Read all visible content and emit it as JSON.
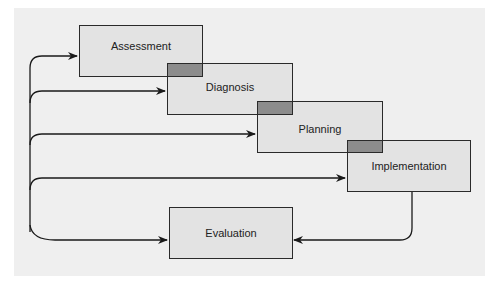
{
  "diagram": {
    "type": "nursing-process-flow",
    "steps": [
      {
        "id": "assessment",
        "label": "Assessment"
      },
      {
        "id": "diagnosis",
        "label": "Diagnosis"
      },
      {
        "id": "planning",
        "label": "Planning"
      },
      {
        "id": "implementation",
        "label": "Implementation"
      },
      {
        "id": "evaluation",
        "label": "Evaluation"
      }
    ],
    "connections": [
      {
        "from": "evaluation-feedback-loop",
        "to": "assessment"
      },
      {
        "from": "evaluation-feedback-loop",
        "to": "diagnosis"
      },
      {
        "from": "evaluation-feedback-loop",
        "to": "planning"
      },
      {
        "from": "evaluation-feedback-loop",
        "to": "implementation"
      },
      {
        "from": "evaluation-feedback-loop",
        "to": "evaluation"
      },
      {
        "from": "implementation",
        "to": "evaluation"
      }
    ],
    "colors": {
      "panel": "#efefef",
      "box_fill": "#e3e3e3",
      "overlap_fill": "#8c8c8c",
      "stroke": "#2a2a2a"
    }
  }
}
